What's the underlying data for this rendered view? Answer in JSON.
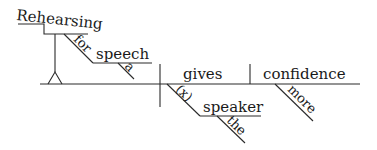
{
  "diagram": {
    "type": "reed-kellogg-sentence-diagram",
    "sentence": "Rehearsing for a speech gives the speaker more confidence.",
    "subject": {
      "gerund": "Rehearsing",
      "modifier_preposition": "for",
      "prep_object": "speech",
      "prep_object_modifier": "a"
    },
    "verb": "gives",
    "direct_object": "confidence",
    "direct_object_modifier": "more",
    "indirect_object": {
      "implied_preposition": "(x)",
      "word": "speaker",
      "modifier": "the"
    }
  },
  "colors": {
    "line": "#2a2a2a",
    "text": "#1a1a1a",
    "background": "#ffffff"
  }
}
